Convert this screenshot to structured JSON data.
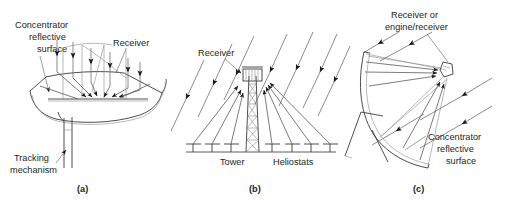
{
  "figure": {
    "type": "technical-line-diagram",
    "background_color": "#ffffff",
    "line_color": "#3a3a3c",
    "ray_color": "#6e6e72",
    "text_color": "#231f20"
  },
  "panels": [
    {
      "id": "a",
      "caption": "(a)",
      "name": "parabolic-trough-concentrator",
      "labels": {
        "concentrator": "Concentrator\nreflective\nsurface",
        "concentrator_line1": "Concentrator",
        "concentrator_line2": "reflective",
        "concentrator_line3": "surface",
        "receiver": "Receiver",
        "tracking_line1": "Tracking",
        "tracking_line2": "mechanism"
      }
    },
    {
      "id": "b",
      "caption": "(b)",
      "name": "central-receiver-power-tower",
      "labels": {
        "receiver": "Receiver",
        "tower": "Tower",
        "heliostats": "Heliostats"
      }
    },
    {
      "id": "c",
      "caption": "(c)",
      "name": "parabolic-dish-concentrator",
      "labels": {
        "receiver_line1": "Receiver or",
        "receiver_line2": "engine/receiver",
        "concentrator_line1": "Concentrator",
        "concentrator_line2": "reflective",
        "concentrator_line3": "surface"
      }
    }
  ]
}
